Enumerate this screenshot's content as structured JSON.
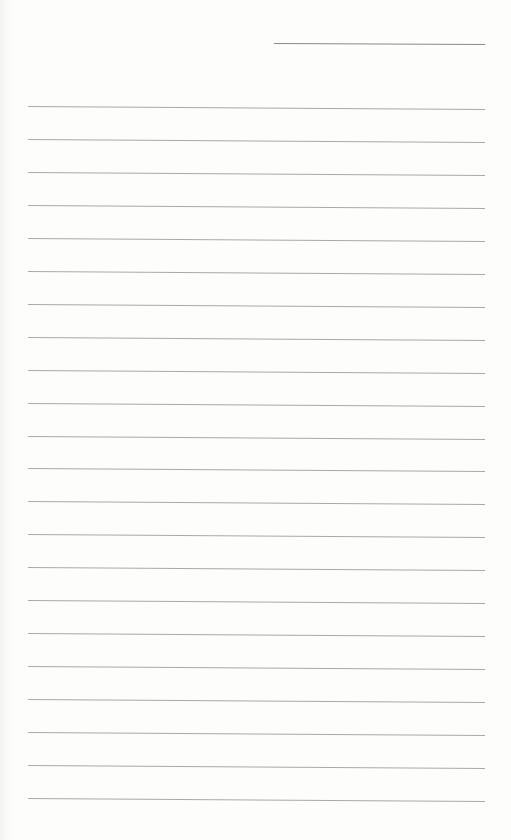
{
  "document": {
    "type": "blank lined paper",
    "header_line": {
      "top": 43,
      "left": 274,
      "width": 211
    },
    "rules": {
      "count": 22,
      "first_top": 106,
      "spacing": 32.95,
      "left": 28,
      "width": 457
    },
    "colors": {
      "paper": "#fdfdfb",
      "line": "#9a9a9a"
    }
  }
}
